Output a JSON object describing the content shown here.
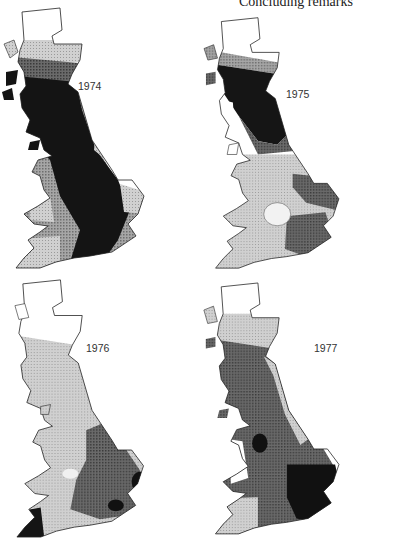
{
  "page": {
    "running_header": "Concluding remarks"
  },
  "maps": [
    {
      "year": "1974",
      "position": "top-left"
    },
    {
      "year": "1975",
      "position": "top-right"
    },
    {
      "year": "1976",
      "position": "bottom-left"
    },
    {
      "year": "1977",
      "position": "bottom-right"
    }
  ],
  "shading_levels": {
    "white": "#ffffff",
    "light": "#c8c8c8",
    "medium": "#8f8f8f",
    "dark": "#5a5a5a",
    "black": "#121212"
  }
}
